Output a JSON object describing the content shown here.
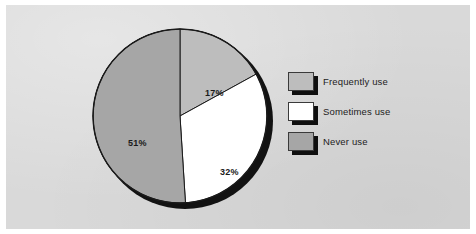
{
  "figure": {
    "background_color": "#ffffff",
    "panel_color": "#d9d9d9"
  },
  "chart_data": {
    "type": "pie",
    "title": "",
    "categories": [
      "Frequently use",
      "Sometimes use",
      "Never use"
    ],
    "values": [
      17,
      32,
      51
    ],
    "value_labels": [
      "17%",
      "32%",
      "51%"
    ],
    "unit": "%",
    "total": 100,
    "start_angle_deg": 0,
    "direction": "clockwise",
    "colors": [
      "#bdbdbd",
      "#ffffff",
      "#a6a6a6"
    ],
    "slice_edge_color": "#1a1a1a",
    "has_drop_shadow": true,
    "grid": false,
    "legend_position": "right",
    "legend": [
      {
        "label": "Frequently use",
        "color": "#bdbdbd",
        "value": 17,
        "value_label": "17%"
      },
      {
        "label": "Sometimes use",
        "color": "#ffffff",
        "value": 32,
        "value_label": "32%"
      },
      {
        "label": "Never use",
        "color": "#a6a6a6",
        "value": 51,
        "value_label": "51%"
      }
    ]
  }
}
